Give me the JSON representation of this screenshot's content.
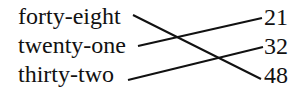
{
  "left_items": [
    {
      "label": "forty-eight"
    },
    {
      "label": "twenty-one"
    },
    {
      "label": "thirty-two"
    }
  ],
  "right_items": [
    {
      "label": "21"
    },
    {
      "label": "32"
    },
    {
      "label": "48"
    }
  ],
  "connections": [
    {
      "from": "forty-eight",
      "to": "48"
    },
    {
      "from": "twenty-one",
      "to": "21"
    },
    {
      "from": "thirty-two",
      "to": "32"
    }
  ]
}
